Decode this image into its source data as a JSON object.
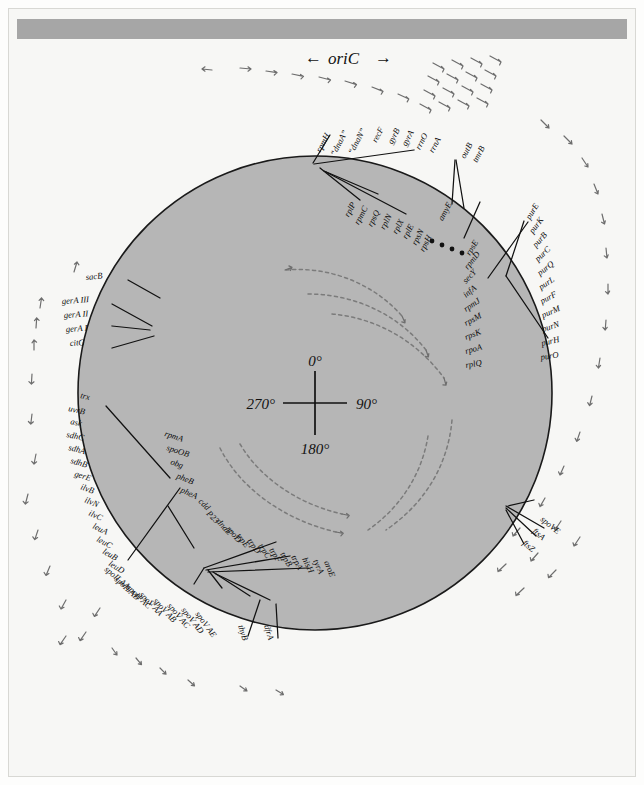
{
  "figure": {
    "title_marker": "oriC",
    "origin_label": "oriC",
    "arrow_left": "←",
    "arrow_right": "→",
    "center_degrees": {
      "top": "0°",
      "right": "90°",
      "bottom": "180°",
      "left": "270°"
    },
    "ellipsis": "• • • •"
  },
  "clusters": {
    "ori_top": {
      "name": "origin-region-genes",
      "genes": [
        "rpmH",
        "“dnaA”",
        "“dnaN”",
        "recF",
        "gyrB",
        "gyrA",
        "rrnO",
        "rrnA"
      ]
    },
    "amy": {
      "name": "amye-cluster",
      "genes": [
        "amyE",
        "outB",
        "tmrB"
      ]
    },
    "ribosomal_one": {
      "name": "s10-spc-operon",
      "genes": [
        "rplP",
        "rpmC",
        "rpsQ",
        "rplN",
        "rplX",
        "rplE",
        "rpsN",
        "rpsH"
      ]
    },
    "ribosomal_two": {
      "name": "alpha-operon",
      "genes": [
        "rpsE",
        "rpmD",
        "secY",
        "infA",
        "rpmJ",
        "rpsM",
        "rpsK",
        "rpoA",
        "rplQ"
      ]
    },
    "pur": {
      "name": "pur-operon",
      "genes": [
        "purE",
        "purK",
        "purB",
        "purC",
        "purQ",
        "purL",
        "purF",
        "purM",
        "purN",
        "purH",
        "purO"
      ]
    },
    "fts": {
      "name": "division-genes",
      "genes": [
        "spoVE",
        "ftsA",
        "ftsZ"
      ]
    },
    "sac": {
      "name": "sacb-gene",
      "genes": [
        "sacB"
      ]
    },
    "gera": {
      "name": "gera-cluster",
      "genes": [
        "gerA III",
        "gerA II",
        "gerA I",
        "citG"
      ]
    },
    "left_arm": {
      "name": "left-arm-genes",
      "genes": [
        "trx",
        "uvrB",
        "ask",
        "sdhC",
        "sdhA",
        "sdhB",
        "gerE",
        "ilvB",
        "ilvN",
        "ilvC",
        "leuA",
        "leuC",
        "leuB",
        "leuD"
      ]
    },
    "rpma": {
      "name": "rpma-cluster",
      "genes": [
        "rpmA",
        "spoOB",
        "obg",
        "pheB",
        "pheA"
      ]
    },
    "trp": {
      "name": "trp-operon",
      "genes": [
        "cdd",
        "P23",
        "dnaE",
        "rpoD",
        "trpE",
        "trpD",
        "trpC",
        "trpF",
        "trpB",
        "trpA",
        "hisH",
        "tyrA",
        "aroE"
      ]
    },
    "spo": {
      "name": "sporulation-operons",
      "genes": [
        "spoII AA",
        "spoII AB",
        "spoII AC",
        "spoV AA",
        "spoV AB",
        "spoV AC",
        "spoV AD",
        "spoV AE"
      ]
    },
    "thy": {
      "name": "thymidylate-genes",
      "genes": [
        "thyB",
        "dfrA"
      ]
    }
  },
  "colors": {
    "chromosome_fill": "#b6b6b6",
    "outline": "#1a1a1a",
    "page_background": "#f7f7f5",
    "header_bar": "#a6a6a6",
    "arrow_gray": "#6e6e6e"
  }
}
